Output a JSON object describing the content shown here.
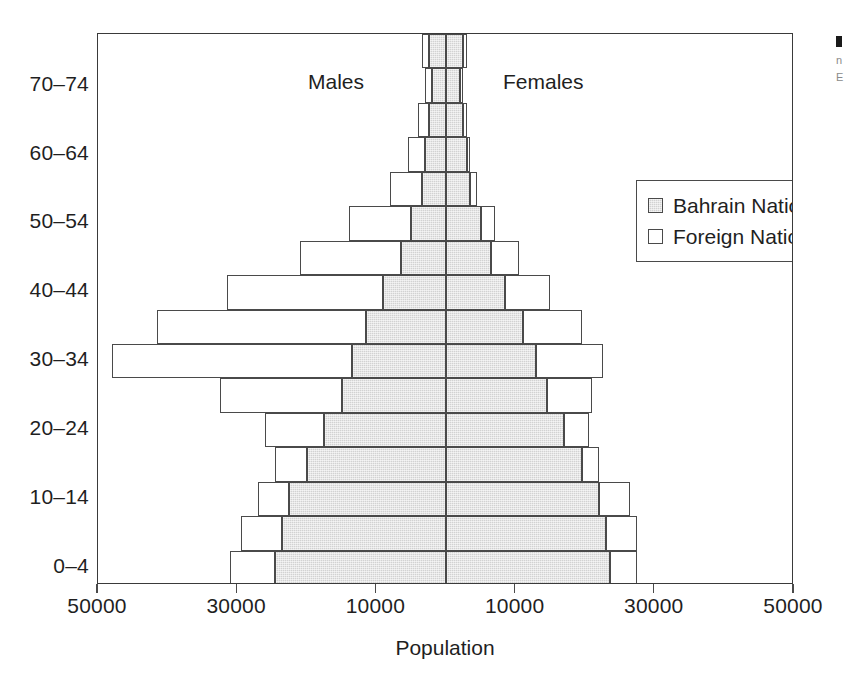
{
  "chart_data": {
    "type": "bar",
    "subtype": "population-pyramid",
    "title": "",
    "xlabel": "Population",
    "ylabel": "",
    "grid": false,
    "axis_max": 50000,
    "xtick_values": [
      -50000,
      -30000,
      -10000,
      10000,
      30000,
      50000
    ],
    "xtick_labels": [
      "50000",
      "30000",
      "10000",
      "10000",
      "30000",
      "50000"
    ],
    "categories": [
      "0–4",
      "5–9",
      "10–14",
      "15–19",
      "20–24",
      "25–29",
      "30–34",
      "35–39",
      "40–44",
      "45–49",
      "50–54",
      "55–59",
      "60–64",
      "65–69",
      "70–74",
      "75+"
    ],
    "ytick_labels": [
      "0–4",
      "10–14",
      "20–24",
      "30–34",
      "40–44",
      "50–54",
      "60–64",
      "70–74"
    ],
    "legend": [
      {
        "name": "Bahrain Nationals",
        "color": "#d2d2d2"
      },
      {
        "name": "Foreign Nationals",
        "color": "#ffffff"
      }
    ],
    "legend_position": "upper-right",
    "annotations": [
      {
        "text": "Males",
        "side": "left"
      },
      {
        "text": "Females",
        "side": "right"
      }
    ],
    "series": [
      {
        "name": "Bahrain Nationals",
        "side": "male",
        "values": [
          24500,
          23500,
          22500,
          20000,
          17500,
          15000,
          13500,
          11500,
          9000,
          6500,
          5000,
          3500,
          3000,
          2500,
          2000,
          2500
        ]
      },
      {
        "name": "Foreign Nationals",
        "side": "male",
        "values": [
          6500,
          6000,
          4500,
          4500,
          8500,
          17500,
          34500,
          30000,
          22500,
          14500,
          9000,
          4500,
          2500,
          1500,
          1000,
          1000
        ]
      },
      {
        "name": "Bahrain Nationals",
        "side": "female",
        "values": [
          23500,
          23000,
          22000,
          19500,
          17000,
          14500,
          13000,
          11000,
          8500,
          6500,
          5000,
          3500,
          3000,
          2500,
          2000,
          2500
        ]
      },
      {
        "name": "Foreign Nationals",
        "side": "female",
        "values": [
          4000,
          4500,
          4500,
          2500,
          3500,
          6500,
          9500,
          8500,
          6500,
          4000,
          2000,
          1000,
          500,
          500,
          500,
          500
        ]
      }
    ]
  },
  "margin_note": {
    "line1": "n",
    "line2": "E"
  }
}
